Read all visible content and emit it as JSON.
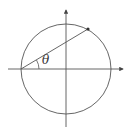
{
  "diagram": {
    "type": "unit-circle-angle",
    "labels": {
      "angle": "θ"
    },
    "colors": {
      "stroke": "#555555",
      "background": "#ffffff"
    },
    "geometry": {
      "center": [
        66,
        69
      ],
      "radius": 45,
      "x_axis": {
        "from": [
          8,
          69
        ],
        "to": [
          124,
          69
        ]
      },
      "y_axis": {
        "from": [
          66,
          127
        ],
        "to": [
          66,
          9
        ]
      },
      "chord_start": [
        21,
        69
      ],
      "chord_end": [
        88,
        29
      ],
      "angle_label_position": [
        44,
        63
      ]
    }
  }
}
